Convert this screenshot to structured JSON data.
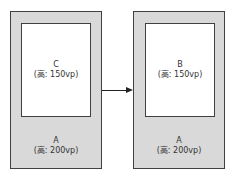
{
  "diagram": {
    "left": {
      "outer": {
        "name": "A",
        "height_label": "(高: 200vp)"
      },
      "inner": {
        "name": "C",
        "height_label": "(高: 150vp)"
      }
    },
    "right": {
      "outer": {
        "name": "A",
        "height_label": "(高: 200vp)"
      },
      "inner": {
        "name": "B",
        "height_label": "(高: 150vp)"
      }
    },
    "arrow": {
      "direction": "left-to-right"
    },
    "colors": {
      "outer_fill": "#d9d9d9",
      "inner_fill": "#ffffff",
      "border": "#404040",
      "arrow": "#222222"
    }
  }
}
